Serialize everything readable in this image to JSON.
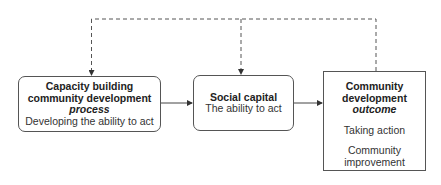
{
  "diagram": {
    "nodes": [
      {
        "id": "capacity-building",
        "title_lines": [
          "Capacity building",
          "community development"
        ],
        "emphasis": "process",
        "subtitle": "Developing the ability to act",
        "shape": "rounded-rectangle"
      },
      {
        "id": "social-capital",
        "title_lines": [
          "Social capital"
        ],
        "subtitle": "The ability to act",
        "shape": "rounded-rectangle"
      },
      {
        "id": "community-development-outcome",
        "title_lines": [
          "Community",
          "development"
        ],
        "emphasis": "outcome",
        "items": [
          "Taking action",
          "Community",
          "improvement"
        ],
        "shape": "rectangle"
      }
    ],
    "edges": [
      {
        "from": "capacity-building",
        "to": "social-capital",
        "style": "solid"
      },
      {
        "from": "social-capital",
        "to": "community-development-outcome",
        "style": "solid"
      },
      {
        "from": "community-development-outcome",
        "to": "capacity-building",
        "style": "dashed",
        "route": "over-top"
      },
      {
        "from": "community-development-outcome",
        "to": "social-capital",
        "style": "dashed",
        "route": "over-top"
      }
    ],
    "colors": {
      "line": "#444444",
      "text": "#222222",
      "background": "#ffffff"
    }
  }
}
